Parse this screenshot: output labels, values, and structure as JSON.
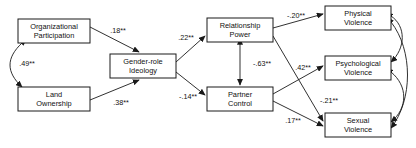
{
  "diagram": {
    "nodes": [
      {
        "id": "organizational_participation",
        "line1": "Organizational",
        "line2": "Participation",
        "x": 18,
        "y": 19,
        "w": 72,
        "h": 24
      },
      {
        "id": "land_ownership",
        "line1": "Land",
        "line2": "Ownership",
        "x": 18,
        "y": 87,
        "w": 72,
        "h": 24
      },
      {
        "id": "gender_role_ideology",
        "line1": "Gender-role",
        "line2": "Ideology",
        "x": 110,
        "y": 54,
        "w": 66,
        "h": 24
      },
      {
        "id": "relationship_power",
        "line1": "Relationship",
        "line2": "Power",
        "x": 207,
        "y": 18,
        "w": 66,
        "h": 24
      },
      {
        "id": "partner_control",
        "line1": "Partner",
        "line2": "Control",
        "x": 207,
        "y": 87,
        "w": 66,
        "h": 24
      },
      {
        "id": "physical_violence",
        "line1": "Physical",
        "line2": "Violence",
        "x": 325,
        "y": 6,
        "w": 66,
        "h": 24
      },
      {
        "id": "psychological_violence",
        "line1": "Psychological",
        "line2": "Violence",
        "x": 325,
        "y": 56,
        "w": 66,
        "h": 24
      },
      {
        "id": "sexual_violence",
        "line1": "Sexual",
        "line2": "Violence",
        "x": 325,
        "y": 113,
        "w": 66,
        "h": 24
      }
    ],
    "paths": [
      {
        "id": "orgpart-to-gri",
        "from": "organizational_participation",
        "to": "gender_role_ideology",
        "coefficient": ".18**",
        "label_x": 118,
        "label_y": 31
      },
      {
        "id": "land-to-gri",
        "from": "land_ownership",
        "to": "gender_role_ideology",
        "coefficient": ".38**",
        "label_x": 121,
        "label_y": 103
      },
      {
        "id": "orgpart-land-correlation",
        "from": "organizational_participation",
        "to": "land_ownership",
        "coefficient": ".49**",
        "label_x": 27,
        "label_y": 64
      },
      {
        "id": "gri-to-relpower",
        "from": "gender_role_ideology",
        "to": "relationship_power",
        "coefficient": ".22**",
        "label_x": 186,
        "label_y": 38
      },
      {
        "id": "gri-to-partnerctrl",
        "from": "gender_role_ideology",
        "to": "partner_control",
        "coefficient": "-.14**",
        "label_x": 188,
        "label_y": 97
      },
      {
        "id": "relpower-partnerctrl-correlation",
        "from": "relationship_power",
        "to": "partner_control",
        "coefficient": "-.63**",
        "label_x": 262,
        "label_y": 64
      },
      {
        "id": "relpower-to-physical",
        "from": "relationship_power",
        "to": "physical_violence",
        "coefficient": "-.20**",
        "label_x": 296,
        "label_y": 16
      },
      {
        "id": "relpower-to-sexual",
        "from": "relationship_power",
        "to": "sexual_violence",
        "coefficient": "-.21**",
        "label_x": 329,
        "label_y": 101
      },
      {
        "id": "partnerctrl-to-psychological",
        "from": "partner_control",
        "to": "psychological_violence",
        "coefficient": ".42**",
        "label_x": 303,
        "label_y": 68
      },
      {
        "id": "partnerctrl-to-sexual",
        "from": "partner_control",
        "to": "sexual_violence",
        "coefficient": ".17**",
        "label_x": 293,
        "label_y": 121
      }
    ],
    "correlations": [
      {
        "id": "physical-psychological-correlation",
        "from": "physical_violence",
        "to": "psychological_violence"
      },
      {
        "id": "psychological-sexual-correlation",
        "from": "psychological_violence",
        "to": "sexual_violence"
      },
      {
        "id": "physical-sexual-correlation",
        "from": "physical_violence",
        "to": "sexual_violence"
      }
    ]
  }
}
